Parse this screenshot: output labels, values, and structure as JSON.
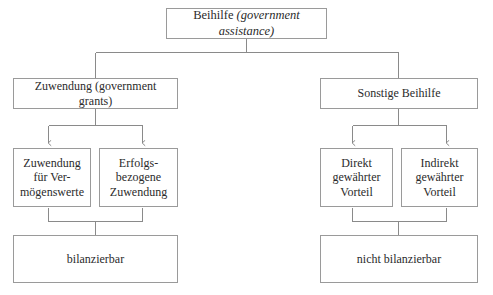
{
  "diagram": {
    "type": "hierarchy-tree",
    "language": "de",
    "levels": 4,
    "colors": {
      "box_border": "#9a9a9a",
      "connector": "#8a8a8a",
      "text": "#2b2b2b",
      "background": "#ffffff"
    },
    "nodes": {
      "root": {
        "term": "Beihilfe",
        "gloss": "(government assistance)",
        "gloss_style": "italic"
      },
      "grants_branch": {
        "term": "Zuwendung",
        "gloss": "(government grants)",
        "gloss_style": "roman"
      },
      "other_branch": {
        "term": "Sonstige Beihilfe",
        "gloss": "",
        "gloss_style": "roman"
      },
      "asset_grant": {
        "text": "Zuwendung\nfür Ver-\nmögenswerte"
      },
      "income_grant": {
        "text": "Erfolgs-\nbezogene\nZuwendung"
      },
      "direct_benefit": {
        "text": "Direkt\ngewährter\nVorteil"
      },
      "indirect_benefit": {
        "text": "Indirekt\ngewährter\nVorteil"
      },
      "recognizable": {
        "text": "bilanzierbar"
      },
      "not_recognizable": {
        "text": "nicht bilanzierbar"
      }
    }
  }
}
